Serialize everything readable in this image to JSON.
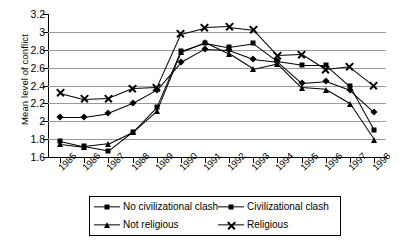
{
  "chart_data": {
    "type": "line",
    "title": "",
    "xlabel": "",
    "ylabel": "Mean level of conflict",
    "categories": [
      "1985",
      "1986",
      "1987",
      "1988",
      "1989",
      "1990",
      "1991",
      "1992",
      "1993",
      "1994",
      "1995",
      "1996",
      "1997",
      "1998"
    ],
    "ylim": [
      1.6,
      3.2
    ],
    "yticks": [
      1.6,
      1.8,
      2.0,
      2.2,
      2.4,
      2.6,
      2.8,
      3.0,
      3.2
    ],
    "ytick_labels": [
      "1.6",
      "1.8",
      "2",
      "2.2",
      "2.4",
      "2.6",
      "2.8",
      "3",
      "3.2"
    ],
    "grid": true,
    "legend_position": "bottom",
    "series": [
      {
        "name": "No civilizational clash",
        "marker": "diamond",
        "values": [
          2.05,
          2.05,
          2.09,
          2.2,
          2.35,
          2.66,
          2.81,
          2.8,
          2.7,
          2.67,
          2.43,
          2.45,
          2.35,
          2.1
        ]
      },
      {
        "name": "Civilizational clash",
        "marker": "square",
        "values": [
          1.78,
          1.72,
          1.67,
          1.88,
          2.16,
          2.79,
          2.88,
          2.83,
          2.87,
          2.67,
          2.63,
          2.63,
          2.39,
          1.9
        ]
      },
      {
        "name": "Not religious",
        "marker": "triangle",
        "values": [
          1.75,
          1.72,
          1.75,
          1.88,
          2.12,
          2.78,
          2.89,
          2.76,
          2.59,
          2.65,
          2.38,
          2.36,
          2.2,
          1.8
        ]
      },
      {
        "name": "Religious",
        "marker": "x",
        "values": [
          2.32,
          2.25,
          2.26,
          2.37,
          2.38,
          2.98,
          3.05,
          3.06,
          3.03,
          2.74,
          2.75,
          2.58,
          2.61,
          2.4
        ]
      }
    ]
  },
  "legend": {
    "entries": [
      {
        "label": "No civilizational clash",
        "marker": "diamond"
      },
      {
        "label": "Civilizational clash",
        "marker": "square"
      },
      {
        "label": "Not religious",
        "marker": "triangle"
      },
      {
        "label": "Religious",
        "marker": "x"
      }
    ]
  },
  "colors": {
    "series": "#000000",
    "gridline": "#9a9a9a",
    "axis": "#000000",
    "background": "#ffffff"
  }
}
